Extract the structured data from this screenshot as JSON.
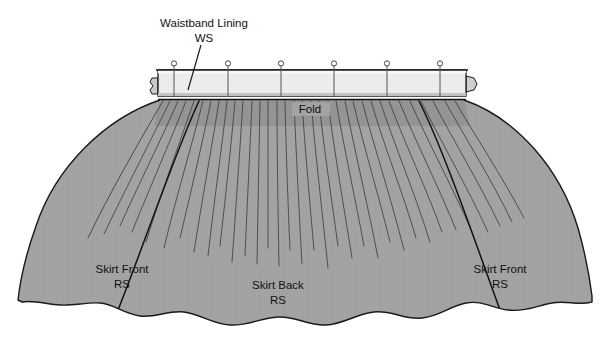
{
  "figure": {
    "type": "sewing-construction-diagram",
    "background_color": "#ffffff"
  },
  "colors": {
    "page_background": "#ffffff",
    "skirt_fabric": "#a3a3a3",
    "skirt_fabric_shadow": "#9a9a9a",
    "waistband_lining": "#ededed",
    "waistband_lining_edge": "#d8d8d8",
    "waistband_top_strip": "#f4f4f4",
    "gather_band": "#8f8f8f",
    "outline": "#1a1a1a",
    "gather_line": "#3a3a3a",
    "seam_line": "#111111",
    "pin_stroke": "#555555",
    "text": "#111111"
  },
  "labels": {
    "waistband_lining": {
      "line1": "Waistband Lining",
      "line2": "WS",
      "x": 204,
      "y": 26,
      "has_leader_line": true
    },
    "fold": {
      "text": "Fold",
      "x": 310,
      "y": 110
    },
    "skirt_front_left": {
      "line1": "Skirt Front",
      "line2": "RS",
      "x": 122,
      "y": 270
    },
    "skirt_back": {
      "line1": "Skirt Back",
      "line2": "RS",
      "x": 278,
      "y": 286
    },
    "skirt_front_right": {
      "line1": "Skirt Front",
      "line2": "RS",
      "x": 500,
      "y": 270
    }
  },
  "waistband": {
    "name": "waistband-lining-band",
    "left": 158,
    "right": 466,
    "top": 70,
    "bottom": 98,
    "fold_line_y": 99,
    "left_tab": true,
    "right_tab": true,
    "pin_count": 6,
    "pin_positions_x": [
      174,
      228,
      281,
      334,
      387,
      440
    ],
    "pin_head_y": 64,
    "pin_tip_y": 96,
    "pin_head_radius": 2.6
  },
  "skirt": {
    "name": "gathered-skirt-body",
    "waist_left": 160,
    "waist_right": 464,
    "hem_left": 18,
    "hem_right": 592,
    "top_y": 100,
    "hem_y": 305,
    "gather_line_count": 31,
    "seams": [
      {
        "name": "left-side-seam",
        "top_x": 200,
        "bottom_x": 108
      },
      {
        "name": "right-side-seam",
        "top_x": 420,
        "bottom_x": 497
      }
    ],
    "panels": [
      "Skirt Front",
      "Skirt Back",
      "Skirt Front"
    ],
    "hem_style": "scalloped"
  }
}
